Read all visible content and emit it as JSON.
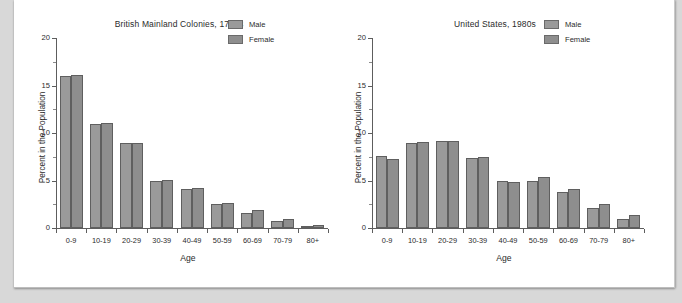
{
  "page": {
    "background_color": "#d8d8d8",
    "paper_color": "#ffffff"
  },
  "legend": {
    "male_label": "Male",
    "female_label": "Female",
    "male_color": "#9a9a9a",
    "female_color": "#8e8e8e"
  },
  "charts": [
    {
      "title": "British Mainland Colonies, 1760s",
      "xlabel": "Age",
      "ylabel": "Percent in the Population"
    },
    {
      "title": "United States, 1980s",
      "xlabel": "Age",
      "ylabel": "Percent in the Population"
    }
  ],
  "chart_data": [
    {
      "type": "bar",
      "title": "British Mainland Colonies, 1760s",
      "xlabel": "Age",
      "ylabel": "Percent in the Population",
      "categories": [
        "0-9",
        "10-19",
        "20-29",
        "30-39",
        "40-49",
        "50-59",
        "60-69",
        "70-79",
        "80+"
      ],
      "series": [
        {
          "name": "Male",
          "values": [
            16.0,
            11.0,
            9.0,
            5.0,
            4.1,
            2.5,
            1.6,
            0.7,
            0.15
          ]
        },
        {
          "name": "Female",
          "values": [
            16.1,
            11.1,
            9.0,
            5.1,
            4.2,
            2.6,
            1.9,
            1.0,
            0.3
          ]
        }
      ],
      "ylim": [
        0,
        20
      ],
      "yticks": [
        0,
        5,
        10,
        15,
        20
      ],
      "ytick_labels": [
        "0",
        "5",
        "10",
        "15",
        "20"
      ],
      "grid": false,
      "legend_position": "top-right"
    },
    {
      "type": "bar",
      "title": "United States, 1980s",
      "xlabel": "Age",
      "ylabel": "Percent in the Population",
      "categories": [
        "0-9",
        "10-19",
        "20-29",
        "30-39",
        "40-49",
        "50-59",
        "60-69",
        "70-79",
        "80+"
      ],
      "series": [
        {
          "name": "Male",
          "values": [
            7.6,
            8.9,
            9.2,
            7.4,
            5.0,
            5.0,
            3.8,
            2.1,
            0.9
          ]
        },
        {
          "name": "Female",
          "values": [
            7.3,
            9.1,
            9.2,
            7.5,
            4.8,
            5.4,
            4.1,
            2.5,
            1.4
          ]
        }
      ],
      "ylim": [
        0,
        20
      ],
      "yticks": [
        0,
        5,
        10,
        15,
        20
      ],
      "ytick_labels": [
        "0",
        "5",
        "10",
        "15",
        "20"
      ],
      "grid": false,
      "legend_position": "top-right"
    }
  ]
}
